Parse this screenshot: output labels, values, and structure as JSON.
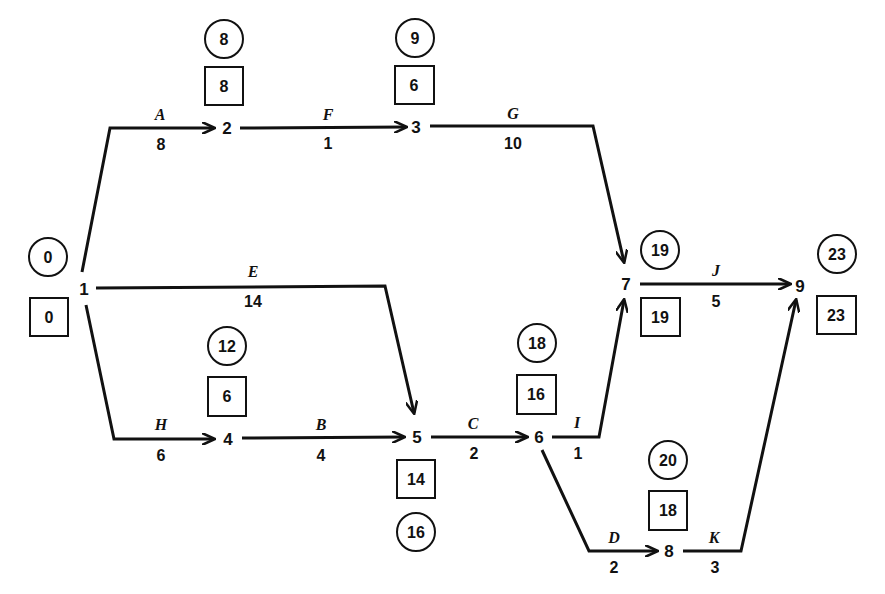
{
  "diagram": {
    "type": "activity-on-arrow network (CPM)",
    "legend_note": "circle = latest event time, box = earliest event time",
    "nodes": [
      {
        "id": "1",
        "label": "1",
        "x": 84,
        "y": 289,
        "circle": "0",
        "box": "0"
      },
      {
        "id": "2",
        "label": "2",
        "x": 227,
        "y": 128,
        "circle": "8",
        "box": "8"
      },
      {
        "id": "3",
        "label": "3",
        "x": 416,
        "y": 127,
        "circle": "9",
        "box": "6"
      },
      {
        "id": "4",
        "label": "4",
        "x": 228,
        "y": 439,
        "circle": "12",
        "box": "6"
      },
      {
        "id": "5",
        "label": "5",
        "x": 417,
        "y": 437,
        "circle": "16",
        "box": "14"
      },
      {
        "id": "6",
        "label": "6",
        "x": 539,
        "y": 437,
        "circle": "18",
        "box": "16"
      },
      {
        "id": "7",
        "label": "7",
        "x": 626,
        "y": 284,
        "circle": "19",
        "box": "19"
      },
      {
        "id": "8",
        "label": "8",
        "x": 669,
        "y": 551,
        "circle": "20",
        "box": "18"
      },
      {
        "id": "9",
        "label": "9",
        "x": 800,
        "y": 286,
        "circle": "23",
        "box": "23"
      }
    ],
    "activities": [
      {
        "name": "A",
        "duration": "8",
        "from": "1",
        "to": "2"
      },
      {
        "name": "F",
        "duration": "1",
        "from": "2",
        "to": "3"
      },
      {
        "name": "G",
        "duration": "10",
        "from": "3",
        "to": "7"
      },
      {
        "name": "E",
        "duration": "14",
        "from": "1",
        "to": "5"
      },
      {
        "name": "H",
        "duration": "6",
        "from": "1",
        "to": "4"
      },
      {
        "name": "B",
        "duration": "4",
        "from": "4",
        "to": "5"
      },
      {
        "name": "C",
        "duration": "2",
        "from": "5",
        "to": "6"
      },
      {
        "name": "I",
        "duration": "1",
        "from": "6",
        "to": "7"
      },
      {
        "name": "J",
        "duration": "5",
        "from": "7",
        "to": "9"
      },
      {
        "name": "D",
        "duration": "2",
        "from": "6",
        "to": "8"
      },
      {
        "name": "K",
        "duration": "3",
        "from": "8",
        "to": "9"
      }
    ]
  }
}
